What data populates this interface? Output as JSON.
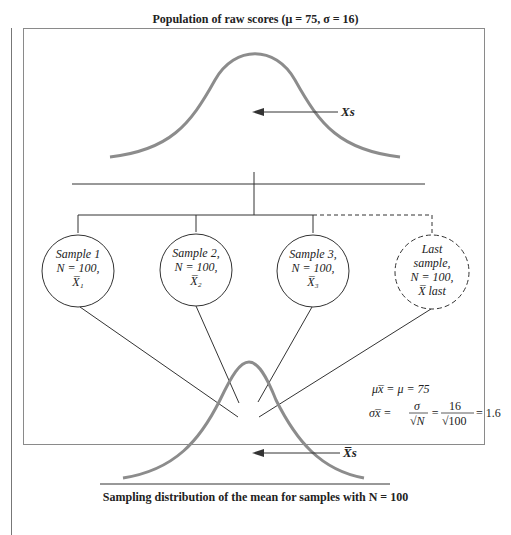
{
  "top_distribution": {
    "title": "Population of raw scores (μ = 75, σ = 16)",
    "arrow_label": "Xs"
  },
  "samples": [
    {
      "line1": "Sample 1",
      "line2": "N = 100,",
      "mean_label": "X̅₁",
      "style": "solid"
    },
    {
      "line1": "Sample 2,",
      "line2": "N = 100,",
      "mean_label": "X̅₂",
      "style": "solid"
    },
    {
      "line1": "Sample 3,",
      "line2": "N = 100,",
      "mean_label": "X̅₃",
      "style": "solid"
    },
    {
      "line0": "Last",
      "line1": "sample,",
      "line2": "N = 100,",
      "mean_label": "X̅ last",
      "style": "dashed"
    }
  ],
  "formulas": {
    "mean": "μx̅ = μ = 75",
    "se_lhs": "σx̅ =",
    "se_num1": "σ",
    "se_den1": "√N",
    "se_num2": "16",
    "se_den2": "√100",
    "se_result": "= 1.6",
    "eq": "="
  },
  "bottom_distribution": {
    "arrow_label": "X̅s",
    "caption": "Sampling distribution of the mean for samples with N = 100"
  },
  "colors": {
    "curve": "#8c8c8c",
    "line": "#333333",
    "frame": "#8a8a8a"
  }
}
